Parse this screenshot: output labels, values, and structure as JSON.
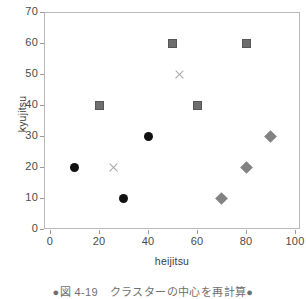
{
  "chart_data": {
    "type": "scatter",
    "title": "",
    "xlabel": "heijitsu",
    "ylabel": "kyujitsu",
    "xlim": [
      0,
      100
    ],
    "ylim": [
      0,
      70
    ],
    "xticks": [
      0,
      20,
      40,
      60,
      80,
      100
    ],
    "yticks": [
      0,
      10,
      20,
      30,
      40,
      50,
      60,
      70
    ],
    "grid": false,
    "legend": "none",
    "series": [
      {
        "name": "cluster-a-points",
        "marker": "circle",
        "color": "#111111",
        "points": [
          {
            "x": 10,
            "y": 20
          },
          {
            "x": 30,
            "y": 10
          },
          {
            "x": 40,
            "y": 30
          }
        ]
      },
      {
        "name": "cluster-b-points",
        "marker": "square",
        "color": "#6e6e6e",
        "points": [
          {
            "x": 20,
            "y": 40
          },
          {
            "x": 50,
            "y": 60
          },
          {
            "x": 60,
            "y": 40
          },
          {
            "x": 80,
            "y": 60
          }
        ]
      },
      {
        "name": "cluster-c-points",
        "marker": "diamond",
        "color": "#828282",
        "points": [
          {
            "x": 70,
            "y": 10
          },
          {
            "x": 80,
            "y": 20
          },
          {
            "x": 90,
            "y": 30
          }
        ]
      },
      {
        "name": "cluster-centroids",
        "marker": "x",
        "color": "#a6a6a6",
        "points": [
          {
            "x": 26,
            "y": 20
          },
          {
            "x": 53,
            "y": 50
          }
        ]
      }
    ]
  },
  "caption": {
    "text": "●図 4-19　クラスターの中心を再計算●"
  }
}
